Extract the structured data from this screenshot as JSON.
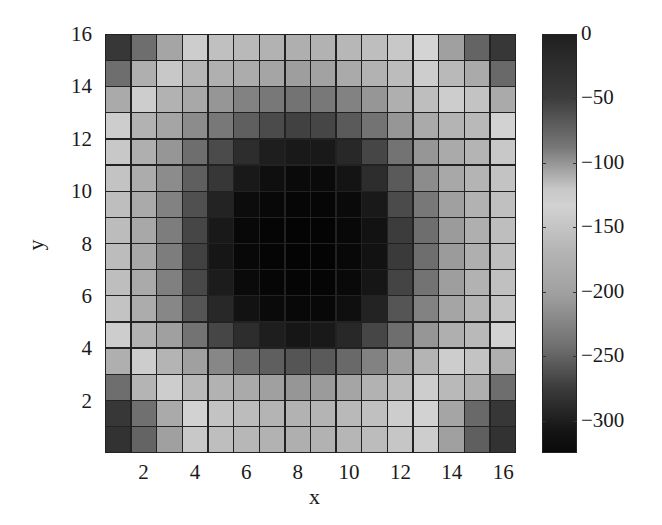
{
  "chart_data": {
    "type": "heatmap",
    "title": "",
    "xlabel": "x",
    "ylabel": "y",
    "x_ticks": [
      "2",
      "4",
      "6",
      "8",
      "10",
      "12",
      "14",
      "16"
    ],
    "y_ticks": [
      "16",
      "14",
      "12",
      "10",
      "8",
      "6",
      "4",
      "2"
    ],
    "xlim": [
      1,
      16
    ],
    "ylim": [
      1,
      16
    ],
    "grid_size": [
      16,
      16
    ],
    "colorbar": {
      "ticks": [
        "0",
        "-50",
        "-100",
        "-150",
        "-200",
        "-250",
        "-300"
      ],
      "range": [
        -325,
        0
      ],
      "colormap": "grayscale: dark at 0, light near -130, dark again toward -325"
    },
    "rows_top_to_bottom_gray": [
      [
        55,
        110,
        165,
        205,
        192,
        185,
        178,
        175,
        178,
        183,
        190,
        200,
        212,
        160,
        100,
        55
      ],
      [
        110,
        175,
        200,
        182,
        176,
        172,
        165,
        158,
        162,
        170,
        178,
        188,
        205,
        185,
        170,
        105
      ],
      [
        170,
        205,
        178,
        168,
        150,
        130,
        120,
        115,
        120,
        130,
        150,
        175,
        190,
        205,
        195,
        170
      ],
      [
        205,
        178,
        165,
        140,
        120,
        95,
        75,
        65,
        70,
        90,
        115,
        150,
        170,
        180,
        185,
        210
      ],
      [
        200,
        175,
        150,
        110,
        75,
        45,
        30,
        25,
        25,
        40,
        70,
        115,
        150,
        170,
        180,
        200
      ],
      [
        195,
        172,
        140,
        95,
        55,
        25,
        15,
        10,
        10,
        20,
        45,
        90,
        140,
        168,
        180,
        195
      ],
      [
        190,
        170,
        130,
        80,
        35,
        12,
        8,
        6,
        6,
        10,
        25,
        75,
        120,
        160,
        178,
        192
      ],
      [
        188,
        168,
        125,
        70,
        25,
        8,
        5,
        4,
        4,
        8,
        18,
        60,
        110,
        155,
        175,
        190
      ],
      [
        188,
        168,
        125,
        65,
        22,
        8,
        5,
        4,
        4,
        8,
        18,
        58,
        110,
        155,
        175,
        190
      ],
      [
        190,
        170,
        128,
        72,
        28,
        10,
        6,
        5,
        5,
        9,
        22,
        68,
        115,
        158,
        178,
        192
      ],
      [
        195,
        172,
        135,
        85,
        40,
        18,
        10,
        8,
        8,
        15,
        35,
        85,
        130,
        165,
        180,
        195
      ],
      [
        205,
        178,
        160,
        115,
        70,
        45,
        30,
        22,
        25,
        40,
        70,
        110,
        150,
        175,
        185,
        210
      ],
      [
        175,
        205,
        180,
        160,
        135,
        110,
        95,
        85,
        90,
        105,
        130,
        160,
        180,
        205,
        195,
        175
      ],
      [
        110,
        180,
        205,
        185,
        178,
        170,
        160,
        150,
        155,
        165,
        178,
        188,
        205,
        185,
        175,
        110
      ],
      [
        55,
        112,
        170,
        210,
        195,
        188,
        180,
        178,
        180,
        185,
        192,
        205,
        210,
        165,
        105,
        55
      ],
      [
        50,
        100,
        160,
        200,
        190,
        183,
        178,
        175,
        178,
        182,
        188,
        198,
        205,
        160,
        95,
        50
      ]
    ]
  }
}
